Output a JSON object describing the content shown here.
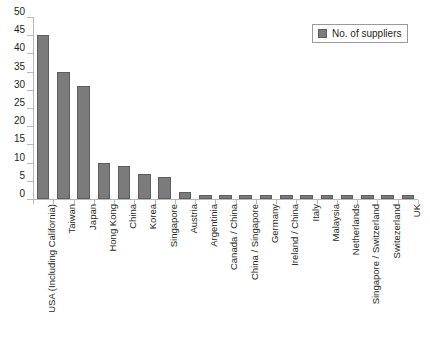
{
  "chart_data": {
    "type": "bar",
    "title": "",
    "xlabel": "",
    "ylabel": "",
    "ylim": [
      0,
      50
    ],
    "ytick_step": 5,
    "grid": false,
    "legend_position": "top-right",
    "series_name": "No. of suppliers",
    "bar_color": "#7b7b7b",
    "bar_edge_color": "#5e5e5e",
    "axis_color": "#b9b9b9",
    "yticks": [
      "0",
      "5",
      "10",
      "15",
      "20",
      "25",
      "30",
      "35",
      "40",
      "45",
      "50"
    ],
    "categories": [
      "USA (Including California)",
      "Taiwan",
      "Japan",
      "Hong Kong",
      "China",
      "Korea",
      "Singapore",
      "Austria",
      "Argentinia",
      "Canada / China",
      "China / Singapore",
      "Germany",
      "Ireland / China",
      "Italy",
      "Malaysia",
      "Netherlands",
      "Singapore / Switzerland",
      "Switezerland",
      "UK"
    ],
    "values": [
      45,
      35,
      31,
      10,
      9,
      7,
      6,
      2,
      1,
      1,
      1,
      1,
      1,
      1,
      1,
      1,
      1,
      1,
      1
    ]
  },
  "legend": {
    "items": [
      {
        "label": "No. of suppliers",
        "color": "#7b7b7b"
      }
    ]
  }
}
